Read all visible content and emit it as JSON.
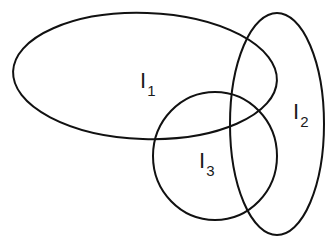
{
  "diagram": {
    "title": "",
    "stroke_color": "#111111",
    "background": "#ffffff",
    "shapes": [
      {
        "id": "I1",
        "type": "ellipse",
        "cx": 145,
        "cy": 76,
        "rx": 132,
        "ry": 63,
        "rotate": 2
      },
      {
        "id": "I2",
        "type": "ellipse",
        "cx": 277,
        "cy": 124,
        "rx": 47,
        "ry": 111,
        "rotate": 0
      },
      {
        "id": "I3",
        "type": "circle",
        "cx": 215,
        "cy": 156,
        "rx": 62,
        "ry": 64,
        "rotate": 0
      }
    ],
    "labels": [
      {
        "id": "I1",
        "base": "I",
        "sub": "1"
      },
      {
        "id": "I2",
        "base": "I",
        "sub": "2"
      },
      {
        "id": "I3",
        "base": "I",
        "sub": "3"
      }
    ]
  }
}
